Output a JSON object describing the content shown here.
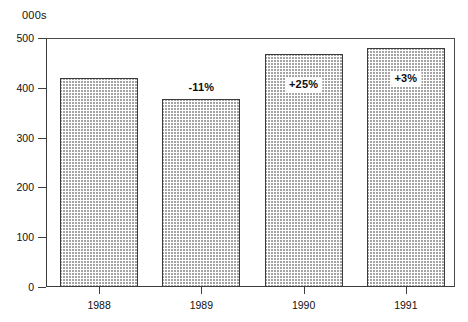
{
  "chart_data": {
    "type": "bar",
    "title": "",
    "subtitle": "",
    "xlabel": "",
    "ylabel": "000s",
    "unit_caption": "000s",
    "categories": [
      "1988",
      "1989",
      "1990",
      "1991"
    ],
    "values": [
      420,
      378,
      468,
      480
    ],
    "ylim": [
      0,
      500
    ],
    "y_ticks": [
      0,
      100,
      200,
      300,
      400,
      500
    ],
    "y_tick_labels": [
      "0",
      "100",
      "200",
      "300",
      "400",
      "500"
    ],
    "grid": false,
    "legend": null,
    "annotations": [
      {
        "category": "1988",
        "text": "",
        "placement": "none"
      },
      {
        "category": "1989",
        "text": "-11%",
        "placement": "above-bar"
      },
      {
        "category": "1990",
        "text": "+25%",
        "placement": "inside-bar"
      },
      {
        "category": "1991",
        "text": "+3%",
        "placement": "inside-bar"
      }
    ],
    "series": [
      {
        "name": "Volume",
        "values": [
          420,
          378,
          468,
          480
        ]
      }
    ],
    "colors": {
      "bar_fill": "#ffffff",
      "bar_hatch": "#5a5a5a",
      "bar_border": "#3c3c3c",
      "axis": "#3f3f3f",
      "text": "#111111"
    }
  }
}
